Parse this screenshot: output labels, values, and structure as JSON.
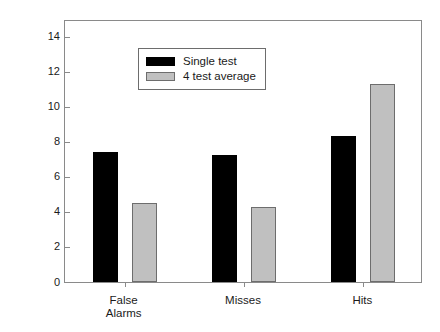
{
  "chart_data": {
    "type": "bar",
    "title": "",
    "subtitle": "",
    "xlabel": "",
    "ylabel": "Proportion of population",
    "categories": [
      "False\nAlarms",
      "Misses",
      "Hits"
    ],
    "category_labels_flat": [
      "False Alarms",
      "Misses",
      "Hits"
    ],
    "series": [
      {
        "name": "Single test",
        "color": "#000000",
        "values": [
          7.4,
          7.25,
          8.35
        ]
      },
      {
        "name": "4 test average",
        "color": "#c0c0c0",
        "values": [
          4.5,
          4.3,
          11.3
        ]
      }
    ],
    "ylim": [
      0,
      15
    ],
    "y_ticks": [
      0,
      2,
      4,
      6,
      8,
      10,
      12,
      14
    ],
    "y_tick_labels": [
      "0",
      "2",
      "4",
      "6",
      "8",
      "10",
      "12",
      "14"
    ],
    "grid": false,
    "legend_position": "top-left",
    "frame": true
  },
  "legend": {
    "entries": [
      {
        "label": "Single test",
        "swatch": "single"
      },
      {
        "label": "4 test average",
        "swatch": "average"
      }
    ]
  }
}
